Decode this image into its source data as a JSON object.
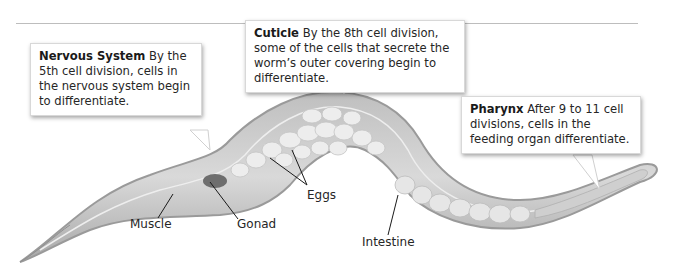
{
  "callouts": {
    "nervous": {
      "title": "Nervous System",
      "text": "By the 5th cell division, cells in the nervous system begin to differentiate."
    },
    "cuticle": {
      "title": "Cuticle",
      "text": "By the 8th cell division, some of the cells that secrete the worm’s outer covering begin to differentiate."
    },
    "pharynx": {
      "title": "Pharynx",
      "text": "After 9 to 11 cell divisions, cells in the feeding organ differentiate."
    }
  },
  "labels": {
    "muscle": "Muscle",
    "gonad": "Gonad",
    "eggs": "Eggs",
    "intestine": "Intestine"
  },
  "colors": {
    "body_outer": "#a9a9a9",
    "body_fill": "#d4d4d4",
    "eggs": "#ececec",
    "gonad": "#6e6e6e",
    "rule": "#bdbdbd"
  }
}
